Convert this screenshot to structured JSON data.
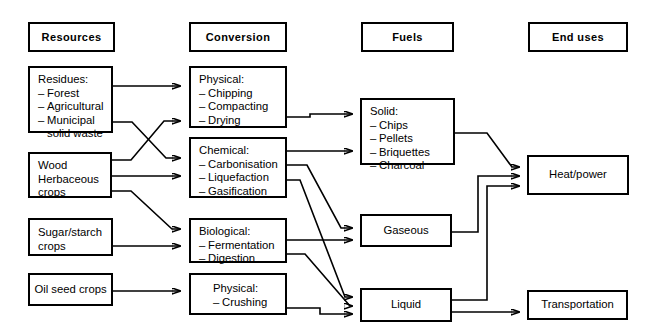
{
  "diagram": {
    "columns": [
      {
        "id": "resources",
        "header": "Resources"
      },
      {
        "id": "conversion",
        "header": "Conversion"
      },
      {
        "id": "fuels",
        "header": "Fuels"
      },
      {
        "id": "enduses",
        "header": "End uses"
      }
    ],
    "nodes": {
      "residues": {
        "title": "Residues:",
        "items": [
          "Forest",
          "Agricultural",
          "Municipal"
        ],
        "continuation": "solid waste"
      },
      "wood": {
        "line1": "Wood",
        "line2": "Herbaceous",
        "line3": "crops"
      },
      "sugar": {
        "line1": "Sugar/starch",
        "line2": "crops"
      },
      "oilseed": {
        "line1": "Oil seed crops"
      },
      "physical_top": {
        "title": "Physical:",
        "items": [
          "Chipping",
          "Compacting",
          "Drying"
        ]
      },
      "chemical": {
        "title": "Chemical:",
        "items": [
          "Carbonisation",
          "Liquefaction",
          "Gasification"
        ]
      },
      "biological": {
        "title": "Biological:",
        "items": [
          "Fermentation",
          "Digestion"
        ]
      },
      "physical_bottom": {
        "title": "Physical:",
        "items": [
          "Crushing"
        ]
      },
      "solid": {
        "title": "Solid:",
        "items": [
          "Chips",
          "Pellets",
          "Briquettes",
          "Charcoal"
        ]
      },
      "gaseous": {
        "label": "Gaseous"
      },
      "liquid": {
        "label": "Liquid"
      },
      "heatpower": {
        "label": "Heat/power"
      },
      "transportation": {
        "label": "Transportation"
      }
    },
    "colors": {
      "stroke": "#000000",
      "background": "#ffffff"
    }
  }
}
